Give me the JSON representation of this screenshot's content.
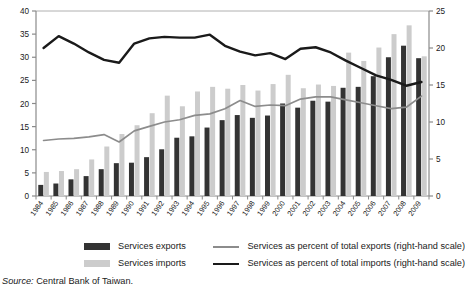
{
  "source_note": {
    "prefix": "Source:",
    "text": "Central Bank of Taiwan."
  },
  "legend": {
    "items": [
      {
        "label": "Services exports",
        "marker": "bar",
        "color": "#333333",
        "data_name": "legend-services-exports"
      },
      {
        "label": "Services imports",
        "marker": "bar",
        "color": "#cccccc",
        "data_name": "legend-services-imports"
      },
      {
        "label": "Services as percent of total exports (right-hand scale)",
        "marker": "line",
        "color": "#8c8c8c",
        "data_name": "legend-services-pct-exports"
      },
      {
        "label": "Services as percent of total imports (right-hand scale)",
        "marker": "line",
        "color": "#1a1a1a",
        "data_name": "legend-services-pct-imports"
      }
    ]
  },
  "chart_data": {
    "type": "bar",
    "title": "",
    "subtitle": "",
    "xlabel": "",
    "ylabel": "",
    "y2label": "",
    "ylim": [
      0,
      40
    ],
    "y2lim": [
      0,
      25
    ],
    "yticks": [
      0,
      5,
      10,
      15,
      20,
      25,
      30,
      35,
      40
    ],
    "y2ticks": [
      0,
      5,
      10,
      15,
      20,
      25
    ],
    "grid": false,
    "legend_position": "below",
    "categories": [
      "1984",
      "1985",
      "1986",
      "1987",
      "1988",
      "1989",
      "1990",
      "1991",
      "1992",
      "1993",
      "1994",
      "1995",
      "1996",
      "1997",
      "1998",
      "1999",
      "2000",
      "2001",
      "2002",
      "2003",
      "2004",
      "2005",
      "2006",
      "2007",
      "2008",
      "2009"
    ],
    "series": [
      {
        "name": "Services exports",
        "type": "bar",
        "axis": "left",
        "color": "#333333",
        "unit": "US$ billions",
        "values": [
          2.4,
          2.7,
          3.6,
          4.3,
          5.8,
          7.1,
          7.2,
          8.4,
          10.1,
          12.6,
          12.9,
          14.8,
          16.4,
          17.5,
          16.9,
          17.4,
          20.0,
          19.1,
          20.6,
          20.4,
          23.4,
          23.6,
          25.9,
          30.0,
          32.5,
          29.8
        ]
      },
      {
        "name": "Services imports",
        "type": "bar",
        "axis": "left",
        "color": "#cccccc",
        "unit": "US$ billions",
        "values": [
          5.2,
          5.4,
          5.8,
          7.9,
          10.7,
          13.4,
          15.3,
          17.9,
          21.7,
          19.4,
          22.6,
          23.6,
          23.2,
          24.0,
          22.8,
          24.2,
          26.2,
          23.3,
          24.1,
          23.8,
          31.0,
          29.2,
          32.1,
          35.0,
          36.9,
          30.2
        ]
      },
      {
        "name": "Services as percent of total exports (right-hand scale)",
        "type": "line",
        "axis": "right",
        "color": "#8c8c8c",
        "unit": "percent",
        "values": [
          7.5,
          7.7,
          7.8,
          8.0,
          8.3,
          7.3,
          8.8,
          9.4,
          10.0,
          10.3,
          10.9,
          11.1,
          11.8,
          12.9,
          12.1,
          12.3,
          12.2,
          13.1,
          13.4,
          13.4,
          13.0,
          12.6,
          12.2,
          11.8,
          12.0,
          13.5
        ]
      },
      {
        "name": "Services as percent of total imports (right-hand scale)",
        "type": "line",
        "axis": "right",
        "color": "#1a1a1a",
        "unit": "percent",
        "values": [
          20.0,
          21.6,
          20.6,
          19.4,
          18.4,
          18.0,
          20.6,
          21.3,
          21.5,
          21.4,
          21.4,
          21.8,
          20.3,
          19.5,
          19.0,
          19.3,
          18.5,
          19.9,
          20.1,
          19.4,
          18.3,
          17.3,
          16.3,
          15.7,
          14.9,
          15.4
        ]
      }
    ]
  }
}
